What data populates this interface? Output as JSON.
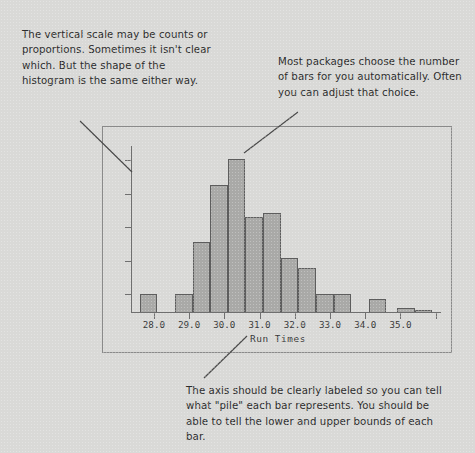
{
  "annotations": {
    "vertical_scale": "The vertical scale may be counts or proportions. Sometimes it isn't clear which. But the shape of the histogram is the same either way.",
    "bar_count": "Most packages choose the number of bars for you automatically. Often you can adjust that choice.",
    "axis_label": "The axis should be clearly labeled so you can tell what \"pile\" each bar represents. You should be able to tell the lower and upper bounds of each bar."
  },
  "chart_data": {
    "type": "bar",
    "title": "",
    "subtitle": "",
    "xlabel": "Run Times",
    "ylabel": "",
    "xlim": [
      27.35,
      36.15
    ],
    "ylim": [
      0,
      26
    ],
    "grid": false,
    "legend": null,
    "xticks": [
      "28.0",
      "29.0",
      "30.0",
      "31.0",
      "32.0",
      "33.0",
      "34.0",
      "35.0"
    ],
    "xtick_values": [
      28.0,
      29.0,
      30.0,
      31.0,
      32.0,
      33.0,
      34.0,
      35.0
    ],
    "ytick_labels": [],
    "ytick_count": 5,
    "bin_width": 0.5,
    "bar_color": "#a9a9a7",
    "bar_edge_color": "#5d5d5d",
    "axis_color": "#6f6f6f",
    "bins": [
      {
        "lower": 27.6,
        "upper": 28.1,
        "value": 3
      },
      {
        "lower": 28.6,
        "upper": 29.1,
        "value": 3
      },
      {
        "lower": 29.1,
        "upper": 29.6,
        "value": 11
      },
      {
        "lower": 29.6,
        "upper": 30.1,
        "value": 20
      },
      {
        "lower": 30.1,
        "upper": 30.6,
        "value": 24
      },
      {
        "lower": 30.6,
        "upper": 31.1,
        "value": 15
      },
      {
        "lower": 31.1,
        "upper": 31.6,
        "value": 15.5
      },
      {
        "lower": 31.6,
        "upper": 32.1,
        "value": 8.5
      },
      {
        "lower": 32.1,
        "upper": 32.6,
        "value": 7
      },
      {
        "lower": 32.6,
        "upper": 33.1,
        "value": 3
      },
      {
        "lower": 33.1,
        "upper": 33.6,
        "value": 3
      },
      {
        "lower": 34.1,
        "upper": 34.6,
        "value": 2.2
      },
      {
        "lower": 34.9,
        "upper": 35.4,
        "value": 0.8
      },
      {
        "lower": 35.4,
        "upper": 35.9,
        "value": 0.5
      }
    ]
  },
  "colors": {
    "background": "#d9d9d7",
    "frame": "#8a8a8a",
    "text": "#2c2c2c",
    "leader": "#4a4a4a"
  }
}
